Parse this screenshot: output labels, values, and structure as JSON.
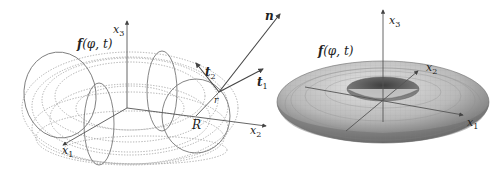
{
  "left_panel": {
    "surface_label": "f(φ,t)",
    "surface_label_func": "f",
    "surface_label_args": "(φ, t)",
    "axes": {
      "x1": {
        "base": "x",
        "sub": "1"
      },
      "x2": {
        "base": "x",
        "sub": "2"
      },
      "x3": {
        "base": "x",
        "sub": "3"
      }
    },
    "major_radius_label": "R",
    "minor_radius_label": "r",
    "vectors": {
      "normal": {
        "base": "n"
      },
      "tangent1": {
        "base": "t",
        "sub": "1"
      },
      "tangent2": {
        "base": "t",
        "sub": "2"
      }
    }
  },
  "right_panel": {
    "surface_label_func": "f",
    "surface_label_args": "(φ, t)",
    "axes": {
      "x1": {
        "base": "x",
        "sub": "1"
      },
      "x2": {
        "base": "x",
        "sub": "2"
      },
      "x3": {
        "base": "x",
        "sub": "3"
      }
    },
    "surface_fill": "#b8b8b8",
    "surface_shadow": "#5a5a5a"
  }
}
